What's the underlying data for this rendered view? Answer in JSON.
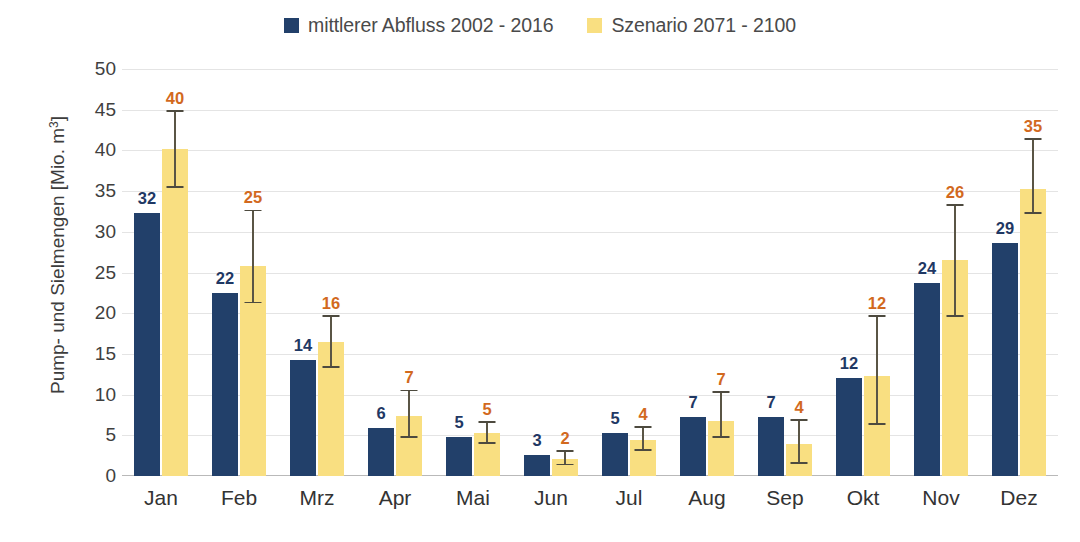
{
  "legend": {
    "entries": [
      {
        "label": "mittlerer Abfluss 2002 - 2016",
        "color": "#22406a",
        "icon": "square-swatch"
      },
      {
        "label": "Szenario 2071 - 2100",
        "color": "#f9df81",
        "icon": "square-swatch"
      }
    ]
  },
  "axis": {
    "y_title_main": "Pump- und Sielmengen [Mio. m",
    "y_title_sup": "3",
    "y_title_tail": "]",
    "y_title_full": "Pump- und Sielmengen [Mio. m³]",
    "y_ticks": [
      "50",
      "45",
      "40",
      "35",
      "30",
      "25",
      "20",
      "15",
      "10",
      "5",
      "0"
    ]
  },
  "chart_data": {
    "type": "bar",
    "title": "",
    "xlabel": "",
    "ylabel": "Pump- und Sielmengen [Mio. m³]",
    "ylim": [
      0,
      50
    ],
    "ytick_step": 5,
    "grid": true,
    "legend_position": "top-center",
    "categories": [
      "Jan",
      "Feb",
      "Mrz",
      "Apr",
      "Mai",
      "Jun",
      "Jul",
      "Aug",
      "Sep",
      "Okt",
      "Nov",
      "Dez"
    ],
    "series": [
      {
        "name": "mittlerer Abfluss 2002 - 2016",
        "color": "#22406a",
        "label_color": "#1f3864",
        "values": [
          32.3,
          22.5,
          14.2,
          5.9,
          4.8,
          2.6,
          5.3,
          7.2,
          7.3,
          12.0,
          23.7,
          28.6
        ],
        "data_labels": [
          "32",
          "22",
          "14",
          "6",
          "5",
          "3",
          "5",
          "7",
          "7",
          "12",
          "24",
          "29"
        ],
        "has_error_bars": false
      },
      {
        "name": "Szenario 2071 - 2100",
        "color": "#f9df81",
        "label_color": "#d2691e",
        "values": [
          40.2,
          25.8,
          16.5,
          7.4,
          5.3,
          2.1,
          4.4,
          6.8,
          3.9,
          12.3,
          26.5,
          35.3
        ],
        "data_labels": [
          "40",
          "25",
          "16",
          "7",
          "5",
          "2",
          "4",
          "7",
          "4",
          "12",
          "26",
          "35"
        ],
        "has_error_bars": true,
        "error_low": [
          35.4,
          21.2,
          13.3,
          4.7,
          3.9,
          1.3,
          3.1,
          4.7,
          1.5,
          6.3,
          19.5,
          32.2
        ],
        "error_high": [
          44.7,
          32.5,
          19.5,
          10.4,
          6.5,
          3.0,
          5.9,
          10.2,
          6.8,
          19.5,
          33.2,
          41.3
        ]
      }
    ]
  }
}
